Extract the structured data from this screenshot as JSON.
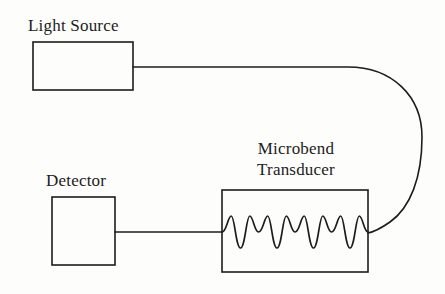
{
  "diagram": {
    "background_color": "#fdfdfb",
    "stroke_color": "#1c1c1c",
    "text_color": "#1c1c1c",
    "canvas": {
      "width": 445,
      "height": 294
    },
    "labels": {
      "light_source": "Light Source",
      "detector": "Detector",
      "transducer_line_1": "Microbend",
      "transducer_line_2": "Transducer"
    },
    "blocks": [
      {
        "name": "light-source",
        "label": "Light Source",
        "x": 33,
        "y": 42,
        "width": 100,
        "height": 48
      },
      {
        "name": "detector",
        "label": "Detector",
        "x": 52,
        "y": 197,
        "width": 63,
        "height": 68
      },
      {
        "name": "microbend-transducer",
        "label": "Microbend Transducer",
        "x": 222,
        "y": 190,
        "width": 146,
        "height": 82
      }
    ],
    "connections": [
      {
        "name": "light-source-to-transducer-fiber",
        "from": "light-source",
        "to": "microbend-transducer",
        "shape": "looping-curve",
        "start": {
          "x": 133,
          "y": 67
        },
        "end": {
          "x": 368,
          "y": 233
        },
        "rightmost_x": 422
      },
      {
        "name": "transducer-to-detector-fiber",
        "from": "microbend-transducer",
        "to": "detector",
        "shape": "straight",
        "start": {
          "x": 222,
          "y": 232
        },
        "end": {
          "x": 115,
          "y": 232
        }
      }
    ],
    "microbend_wave": {
      "name": "microbend-wave",
      "periods": 4,
      "amplitude": 8,
      "baseline_y": 232,
      "start_x": 222,
      "end_x": 368
    }
  }
}
